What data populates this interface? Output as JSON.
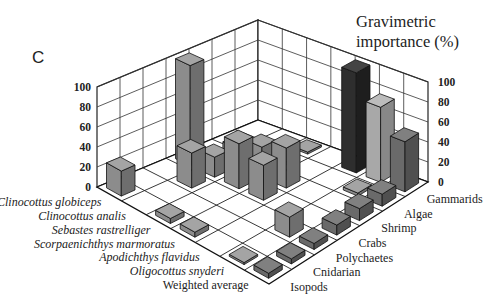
{
  "panel_label": "C",
  "title_line1": "Gravimetric",
  "title_line2": "importance (%)",
  "chart_data": {
    "type": "bar3d",
    "title": "Gravimetric importance (%)",
    "panel": "C",
    "zlabel": "Gravimetric importance (%)",
    "zlim": [
      0,
      100
    ],
    "z_ticks": [
      0,
      20,
      40,
      60,
      80,
      100
    ],
    "species": [
      "Clinocottus globiceps",
      "Clinocottus analis",
      "Sebastes rastrelliger",
      "Scorpaenichthys marmoratus",
      "Apodichthys flavidus",
      "Oligocottus snyderi",
      "Weighted average"
    ],
    "prey": [
      "Gammarids",
      "Algae",
      "Shrimp",
      "Crabs",
      "Polychaetes",
      "Cnidarian",
      "Isopods"
    ],
    "series": [
      {
        "name": "Gammarids",
        "values": [
          0,
          0,
          2,
          0,
          100,
          75,
          50
        ]
      },
      {
        "name": "Algae",
        "values": [
          0,
          5,
          3,
          0,
          0,
          3,
          12
        ]
      },
      {
        "name": "Shrimp",
        "values": [
          0,
          18,
          30,
          40,
          0,
          0,
          12
        ]
      },
      {
        "name": "Crabs",
        "values": [
          100,
          20,
          45,
          35,
          0,
          0,
          10
        ]
      },
      {
        "name": "Polychaetes",
        "values": [
          0,
          35,
          0,
          0,
          0,
          20,
          6
        ]
      },
      {
        "name": "Cnidarian",
        "values": [
          0,
          0,
          0,
          0,
          0,
          0,
          5
        ]
      },
      {
        "name": "Isopods",
        "values": [
          25,
          0,
          5,
          5,
          0,
          0.5,
          5
        ]
      }
    ],
    "grid": true,
    "legend": null
  }
}
